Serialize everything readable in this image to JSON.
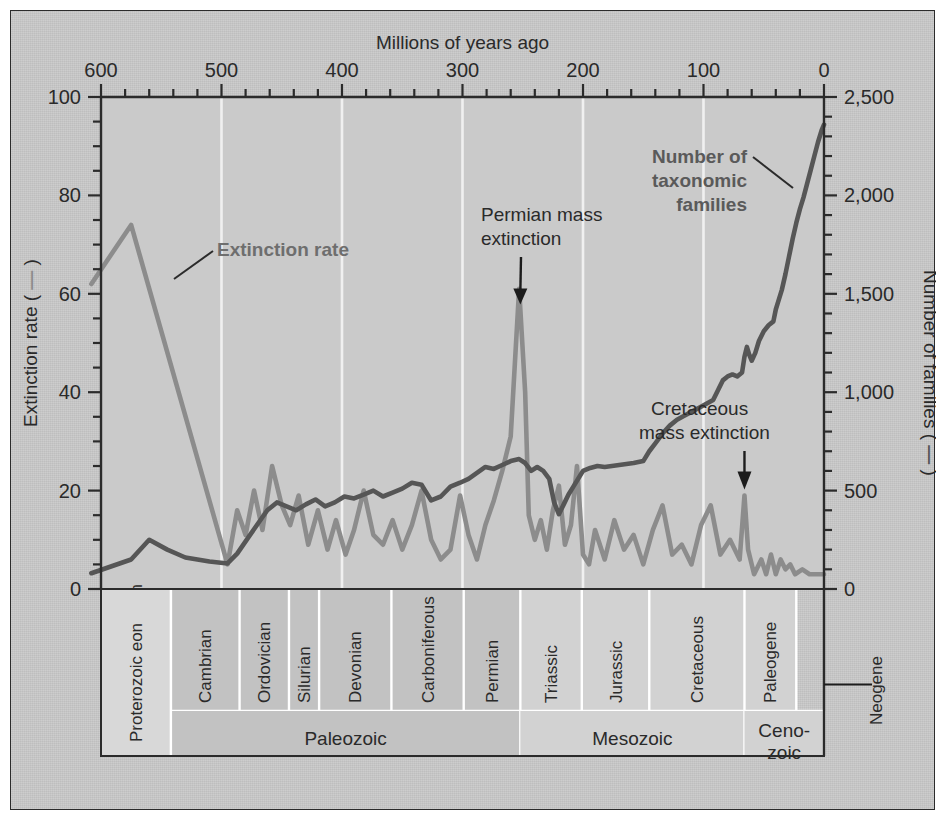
{
  "figure": {
    "top_axis_title": "Millions of years ago",
    "left_axis_title_pre": "Extinction rate (",
    "left_axis_title_post": ")",
    "right_axis_title_pre": "Number of families (",
    "right_axis_title_post": ")"
  },
  "annotations": {
    "extinction_rate": "Extinction rate",
    "families_line1": "Number of",
    "families_line2": "taxonomic",
    "families_line3": "families",
    "permian_line1": "Permian mass",
    "permian_line2": "extinction",
    "cretaceous_line1": "Cretaceous",
    "cretaceous_line2": "mass extinction",
    "neogene": "Neogene"
  },
  "colors": {
    "background": "#c9c9c9",
    "frame": "#2b2b2b",
    "extinction_line": "#8c8c8c",
    "families_line": "#565656",
    "gridline": "#f0f0f0",
    "band_light": "#d6d6d6",
    "band_mid": "#c2c2c2",
    "band_dark": "#b4b4b4"
  },
  "chart_data": {
    "type": "line",
    "title": "Millions of years ago",
    "xlabel": "Millions of years ago",
    "xlim": [
      600,
      0
    ],
    "x_ticks": [
      600,
      500,
      400,
      300,
      200,
      100,
      0
    ],
    "x_minor_step": 20,
    "grid": true,
    "axes": [
      {
        "id": "left",
        "label": "Extinction rate",
        "ylim": [
          0,
          100
        ],
        "ticks": [
          0,
          20,
          40,
          60,
          80,
          100
        ],
        "minor_step": 5
      },
      {
        "id": "right",
        "label": "Number of families",
        "ylim": [
          0,
          2500
        ],
        "ticks": [
          0,
          500,
          1000,
          1500,
          2000,
          2500
        ],
        "tick_labels": [
          "0",
          "500",
          "1,000",
          "1,500",
          "2,000",
          "2,500"
        ],
        "minor_step": 100
      }
    ],
    "series": [
      {
        "name": "Extinction rate",
        "axis": "left",
        "color": "#8c8c8c",
        "units": "percent of families going extinct per stage",
        "points": [
          [
            608,
            62
          ],
          [
            575,
            74
          ],
          [
            495,
            5
          ],
          [
            487,
            16
          ],
          [
            480,
            11
          ],
          [
            473,
            20
          ],
          [
            466,
            12
          ],
          [
            458,
            25
          ],
          [
            450,
            17
          ],
          [
            443,
            13
          ],
          [
            436,
            19
          ],
          [
            428,
            9
          ],
          [
            420,
            16
          ],
          [
            412,
            8
          ],
          [
            405,
            14
          ],
          [
            397,
            7
          ],
          [
            390,
            12
          ],
          [
            382,
            20
          ],
          [
            374,
            11
          ],
          [
            366,
            9
          ],
          [
            358,
            14
          ],
          [
            350,
            8
          ],
          [
            342,
            13
          ],
          [
            334,
            20
          ],
          [
            326,
            10
          ],
          [
            318,
            6
          ],
          [
            310,
            8
          ],
          [
            302,
            19
          ],
          [
            295,
            11
          ],
          [
            288,
            6
          ],
          [
            281,
            13
          ],
          [
            274,
            18
          ],
          [
            267,
            24
          ],
          [
            260,
            31
          ],
          [
            253,
            61
          ],
          [
            248,
            40
          ],
          [
            245,
            15
          ],
          [
            240,
            10
          ],
          [
            235,
            14
          ],
          [
            230,
            8
          ],
          [
            225,
            16
          ],
          [
            220,
            21
          ],
          [
            215,
            9
          ],
          [
            210,
            13
          ],
          [
            205,
            25
          ],
          [
            200,
            7
          ],
          [
            195,
            5
          ],
          [
            190,
            12
          ],
          [
            182,
            6
          ],
          [
            174,
            14
          ],
          [
            166,
            8
          ],
          [
            158,
            11
          ],
          [
            150,
            5
          ],
          [
            142,
            12
          ],
          [
            134,
            17
          ],
          [
            126,
            7
          ],
          [
            118,
            9
          ],
          [
            110,
            5
          ],
          [
            102,
            13
          ],
          [
            94,
            17
          ],
          [
            86,
            7
          ],
          [
            78,
            10
          ],
          [
            70,
            6
          ],
          [
            66,
            19
          ],
          [
            63,
            8
          ],
          [
            58,
            3
          ],
          [
            52,
            6
          ],
          [
            48,
            3
          ],
          [
            44,
            7
          ],
          [
            40,
            3
          ],
          [
            36,
            6
          ],
          [
            32,
            4
          ],
          [
            28,
            5
          ],
          [
            24,
            3
          ],
          [
            18,
            4
          ],
          [
            12,
            3
          ],
          [
            6,
            3
          ],
          [
            0,
            3
          ]
        ]
      },
      {
        "name": "Number of taxonomic families",
        "axis": "right",
        "color": "#565656",
        "units": "families",
        "points": [
          [
            608,
            80
          ],
          [
            575,
            150
          ],
          [
            560,
            250
          ],
          [
            545,
            200
          ],
          [
            530,
            160
          ],
          [
            510,
            140
          ],
          [
            495,
            130
          ],
          [
            487,
            180
          ],
          [
            478,
            260
          ],
          [
            470,
            330
          ],
          [
            462,
            400
          ],
          [
            454,
            440
          ],
          [
            446,
            420
          ],
          [
            438,
            400
          ],
          [
            430,
            430
          ],
          [
            422,
            455
          ],
          [
            414,
            420
          ],
          [
            406,
            440
          ],
          [
            398,
            470
          ],
          [
            390,
            460
          ],
          [
            382,
            480
          ],
          [
            374,
            500
          ],
          [
            366,
            470
          ],
          [
            358,
            490
          ],
          [
            350,
            510
          ],
          [
            342,
            540
          ],
          [
            334,
            530
          ],
          [
            326,
            450
          ],
          [
            318,
            470
          ],
          [
            310,
            520
          ],
          [
            302,
            540
          ],
          [
            295,
            560
          ],
          [
            288,
            590
          ],
          [
            281,
            620
          ],
          [
            274,
            610
          ],
          [
            267,
            630
          ],
          [
            260,
            650
          ],
          [
            253,
            660
          ],
          [
            248,
            640
          ],
          [
            243,
            600
          ],
          [
            238,
            620
          ],
          [
            233,
            600
          ],
          [
            228,
            560
          ],
          [
            224,
            440
          ],
          [
            220,
            380
          ],
          [
            216,
            430
          ],
          [
            212,
            480
          ],
          [
            208,
            520
          ],
          [
            204,
            560
          ],
          [
            200,
            600
          ],
          [
            194,
            615
          ],
          [
            188,
            625
          ],
          [
            182,
            620
          ],
          [
            176,
            625
          ],
          [
            170,
            630
          ],
          [
            164,
            635
          ],
          [
            158,
            640
          ],
          [
            150,
            650
          ],
          [
            145,
            700
          ],
          [
            140,
            740
          ],
          [
            134,
            790
          ],
          [
            128,
            830
          ],
          [
            122,
            860
          ],
          [
            116,
            880
          ],
          [
            110,
            900
          ],
          [
            104,
            920
          ],
          [
            98,
            940
          ],
          [
            92,
            960
          ],
          [
            88,
            1010
          ],
          [
            84,
            1060
          ],
          [
            80,
            1080
          ],
          [
            76,
            1090
          ],
          [
            72,
            1080
          ],
          [
            68,
            1100
          ],
          [
            66,
            1180
          ],
          [
            64,
            1230
          ],
          [
            62,
            1190
          ],
          [
            60,
            1160
          ],
          [
            57,
            1200
          ],
          [
            54,
            1260
          ],
          [
            50,
            1310
          ],
          [
            46,
            1340
          ],
          [
            42,
            1360
          ],
          [
            40,
            1420
          ],
          [
            38,
            1460
          ],
          [
            35,
            1520
          ],
          [
            32,
            1600
          ],
          [
            29,
            1690
          ],
          [
            26,
            1780
          ],
          [
            23,
            1860
          ],
          [
            20,
            1930
          ],
          [
            17,
            1990
          ],
          [
            14,
            2060
          ],
          [
            11,
            2130
          ],
          [
            8,
            2200
          ],
          [
            5,
            2270
          ],
          [
            2,
            2330
          ],
          [
            0,
            2360
          ]
        ]
      }
    ],
    "event_markers": [
      {
        "name": "Permian mass extinction",
        "x": 252,
        "axis": "left",
        "value": 57
      },
      {
        "name": "Cretaceous mass extinction",
        "x": 66,
        "axis": "left",
        "value": 19
      }
    ],
    "geologic_periods": [
      {
        "label": "Proterozoic eon",
        "start": 600,
        "end": 542,
        "shade": "light"
      },
      {
        "label": "Cambrian",
        "start": 542,
        "end": 485,
        "shade": "dark"
      },
      {
        "label": "Ordovician",
        "start": 485,
        "end": 444,
        "shade": "dark"
      },
      {
        "label": "Silurian",
        "start": 444,
        "end": 419,
        "shade": "dark"
      },
      {
        "label": "Devonian",
        "start": 419,
        "end": 359,
        "shade": "dark"
      },
      {
        "label": "Carboniferous",
        "start": 359,
        "end": 299,
        "shade": "dark"
      },
      {
        "label": "Permian",
        "start": 299,
        "end": 252,
        "shade": "dark"
      },
      {
        "label": "Triassic",
        "start": 252,
        "end": 201,
        "shade": "mid"
      },
      {
        "label": "Jurassic",
        "start": 201,
        "end": 145,
        "shade": "mid"
      },
      {
        "label": "Cretaceous",
        "start": 145,
        "end": 66,
        "shade": "mid"
      },
      {
        "label": "Paleogene",
        "start": 66,
        "end": 23,
        "shade": "mid"
      },
      {
        "label": "Neogene",
        "start": 23,
        "end": 0,
        "shade": "mid",
        "outside": true
      }
    ],
    "geologic_eras": [
      {
        "label": "Paleozoic",
        "start": 542,
        "end": 252,
        "shade": "dark"
      },
      {
        "label": "Mesozoic",
        "start": 252,
        "end": 66,
        "shade": "mid"
      },
      {
        "label": "Ceno-zoic",
        "line1": "Ceno-",
        "line2": "zoic",
        "start": 66,
        "end": 0,
        "shade": "mid"
      }
    ]
  }
}
